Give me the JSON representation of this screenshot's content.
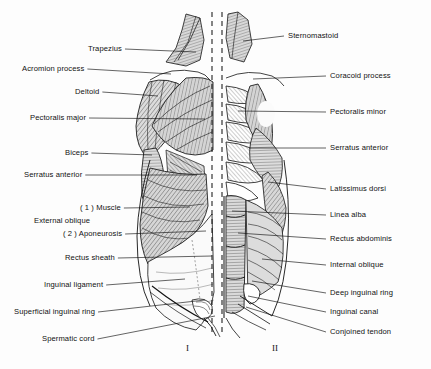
{
  "figure": {
    "panels": [
      {
        "numeral": "I",
        "side": "left",
        "description": "superficial layer"
      },
      {
        "numeral": "II",
        "side": "right",
        "description": "deep layer"
      }
    ],
    "colors": {
      "background": "#fdfdfd",
      "ink": "#111111",
      "muscle_fill": "#d8d8d8",
      "muscle_fill_light": "#e8e8e8",
      "hatch": "#3a3a3a",
      "midline": "#222222"
    }
  },
  "labels_left": [
    {
      "text": "Trapezius",
      "x": 88,
      "y": 45,
      "anchor_x": 196,
      "anchor_y": 52
    },
    {
      "text": "Acromion process",
      "x": 22,
      "y": 65,
      "anchor_x": 171,
      "anchor_y": 74
    },
    {
      "text": "Deltoid",
      "x": 75,
      "y": 88,
      "anchor_x": 158,
      "anchor_y": 96
    },
    {
      "text": "Pectoralis major",
      "x": 30,
      "y": 114,
      "anchor_x": 205,
      "anchor_y": 119
    },
    {
      "text": "Biceps",
      "x": 65,
      "y": 149,
      "anchor_x": 152,
      "anchor_y": 155
    },
    {
      "text": "Serratus anterior",
      "x": 24,
      "y": 171,
      "anchor_x": 197,
      "anchor_y": 175
    },
    {
      "text": "( 1 ) Muscle",
      "x": 80,
      "y": 204,
      "anchor_x": 190,
      "anchor_y": 207
    },
    {
      "text": "External oblique",
      "x": 34,
      "y": 217,
      "anchor_x": null,
      "anchor_y": null
    },
    {
      "text": "( 2 ) Aponeurosis",
      "x": 63,
      "y": 230,
      "anchor_x": 206,
      "anchor_y": 231
    },
    {
      "text": "Rectus sheath",
      "x": 65,
      "y": 254,
      "anchor_x": 212,
      "anchor_y": 256
    },
    {
      "text": "Inguinal ligament",
      "x": 44,
      "y": 281,
      "anchor_x": 185,
      "anchor_y": 279
    },
    {
      "text": "Superficial inguinal ring",
      "x": 14,
      "y": 308,
      "anchor_x": 205,
      "anchor_y": 300
    },
    {
      "text": "Spermatic cord",
      "x": 42,
      "y": 335,
      "anchor_x": 215,
      "anchor_y": 316
    }
  ],
  "labels_right": [
    {
      "text": "Sternomastoid",
      "x": 288,
      "y": 32,
      "anchor_x": 243,
      "anchor_y": 41
    },
    {
      "text": "Coracoid process",
      "x": 330,
      "y": 72,
      "anchor_x": 253,
      "anchor_y": 79
    },
    {
      "text": "Pectoralis minor",
      "x": 330,
      "y": 108,
      "anchor_x": 238,
      "anchor_y": 111
    },
    {
      "text": "Serratus anterior",
      "x": 330,
      "y": 144,
      "anchor_x": 249,
      "anchor_y": 148
    },
    {
      "text": "Latissimus dorsi",
      "x": 330,
      "y": 185,
      "anchor_x": 268,
      "anchor_y": 182
    },
    {
      "text": "Linea alba",
      "x": 330,
      "y": 211,
      "anchor_x": 232,
      "anchor_y": 211
    },
    {
      "text": "Rectus abdominis",
      "x": 330,
      "y": 235,
      "anchor_x": 238,
      "anchor_y": 233
    },
    {
      "text": "Internal oblique",
      "x": 330,
      "y": 261,
      "anchor_x": 262,
      "anchor_y": 259
    },
    {
      "text": "Deep inguinal ring",
      "x": 330,
      "y": 289,
      "anchor_x": 252,
      "anchor_y": 281
    },
    {
      "text": "Inguinal canal",
      "x": 330,
      "y": 308,
      "anchor_x": 248,
      "anchor_y": 296
    },
    {
      "text": "Conjoined tendon",
      "x": 330,
      "y": 328,
      "anchor_x": 246,
      "anchor_y": 307
    }
  ],
  "numerals": [
    {
      "text": "I",
      "x": 186,
      "y": 343
    },
    {
      "text": "II",
      "x": 272,
      "y": 343
    }
  ]
}
